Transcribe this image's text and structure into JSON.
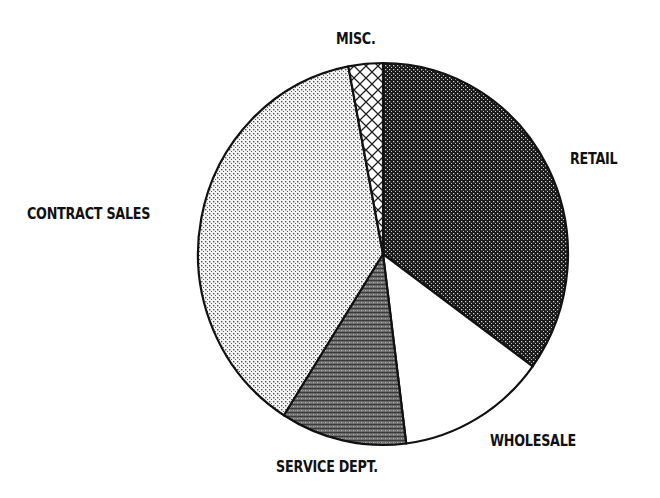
{
  "chart_data": {
    "type": "pie",
    "title": "",
    "start_angle_deg": 0,
    "direction": "clockwise",
    "categories": [
      "RETAIL",
      "WHOLESALE",
      "SERVICE DEPT.",
      "CONTRACT SALES",
      "MISC."
    ],
    "values": [
      35,
      13,
      11,
      38,
      3
    ],
    "unit": "percent (estimated from slice angles)",
    "slices": [
      {
        "label": "RETAIL",
        "value": 35,
        "pattern": "dense-dark-dots",
        "fill": "#3a3a3a"
      },
      {
        "label": "WHOLESALE",
        "value": 13,
        "pattern": "solid-white",
        "fill": "#ffffff"
      },
      {
        "label": "SERVICE DEPT.",
        "value": 11,
        "pattern": "dark-horizontal-stipple",
        "fill": "#5e5e5e"
      },
      {
        "label": "CONTRACT SALES",
        "value": 38,
        "pattern": "light-dots",
        "fill": "#d4d4d4"
      },
      {
        "label": "MISC.",
        "value": 3,
        "pattern": "crosshatch",
        "fill": "#ffffff"
      }
    ],
    "legend": "none (slices labeled directly)"
  },
  "labels": {
    "retail": "RETAIL",
    "wholesale": "WHOLESALE",
    "service": "SERVICE DEPT.",
    "contract": "CONTRACT SALES",
    "misc": "MISC."
  }
}
